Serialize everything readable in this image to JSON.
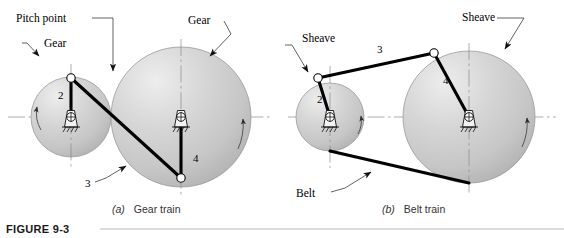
{
  "figure": {
    "number": "FIGURE 9-3",
    "panels": [
      {
        "tag": "(a)",
        "caption": "Gear train"
      },
      {
        "tag": "(b)",
        "caption": "Belt train"
      }
    ]
  },
  "gear_train": {
    "labels": {
      "pitch_point": "Pitch point",
      "gear_small": "Gear",
      "gear_large": "Gear",
      "link2": "2",
      "link3": "3",
      "link4": "4"
    }
  },
  "belt_train": {
    "labels": {
      "sheave_small": "Sheave",
      "sheave_large": "Sheave",
      "belt": "Belt",
      "link2": "2",
      "link3": "3",
      "link4": "4"
    }
  },
  "colors": {
    "wheel_fill": "#c9c9c9",
    "wheel_highlight": "#eeeeee",
    "wheel_edge": "#9a9a9a",
    "link_stroke": "#000000",
    "centerline": "#8a8a8a",
    "leader": "#3a3a3a",
    "caption_text": "#333333",
    "title_text": "#1a1a1a",
    "background": "#ffffff"
  }
}
